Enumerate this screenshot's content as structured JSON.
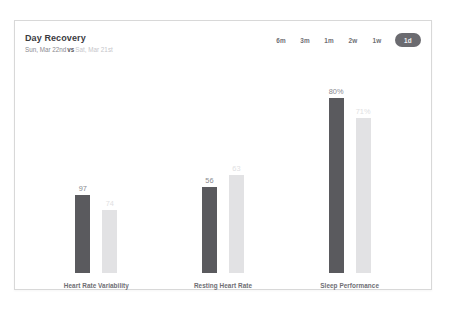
{
  "card": {
    "header": {
      "title": "Day Recovery",
      "subtitle_primary": "Sun, Mar 22nd",
      "subtitle_vs": "vs",
      "subtitle_secondary": "Sat, Mar 21st"
    },
    "range_selector": {
      "options": [
        {
          "label": "6m",
          "selected": false
        },
        {
          "label": "3m",
          "selected": false
        },
        {
          "label": "1m",
          "selected": false
        },
        {
          "label": "2w",
          "selected": false
        },
        {
          "label": "1w",
          "selected": false
        },
        {
          "label": "1d",
          "selected": true
        }
      ]
    }
  },
  "chart_data": {
    "type": "bar",
    "title": "Day Recovery",
    "xlabel": "",
    "ylabel": "",
    "grid": false,
    "legend_position": "none",
    "categories": [
      "Heart Rate Variability",
      "Resting Heart Rate",
      "Sleep Performance"
    ],
    "series": [
      {
        "name": "Sun, Mar 22nd",
        "color": "#5a5a5e",
        "values": [
          97,
          56,
          80
        ],
        "labels": [
          "97",
          "56",
          "80%"
        ]
      },
      {
        "name": "Sat, Mar 21st",
        "color": "#e2e2e4",
        "values": [
          74,
          63,
          71
        ],
        "labels": [
          "74",
          "63",
          "71%"
        ]
      }
    ],
    "bar_pixel_heights": {
      "Heart Rate Variability": {
        "current": 78,
        "previous": 63
      },
      "Resting Heart Rate": {
        "current": 86,
        "previous": 98
      },
      "Sleep Performance": {
        "current": 176,
        "previous": 155
      }
    }
  },
  "colors": {
    "current_bar": "#5a5a5e",
    "previous_bar": "#e2e2e4",
    "selected_pill": "#6b6b70",
    "card_border": "#d8d8d8",
    "label_text": "#6e6e73"
  }
}
